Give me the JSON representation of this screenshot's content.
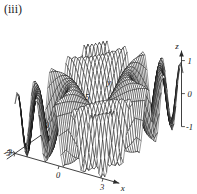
{
  "figure": {
    "panel_label": "(iii)",
    "type": "3d-surface-wireframe",
    "background_color": "#ffffff",
    "mesh_color": "#0d0d0d",
    "axis_color": "#2b2b2b"
  },
  "axes": {
    "x": {
      "label": "x",
      "ticks": [
        "-3",
        "0",
        "3"
      ],
      "range": [
        -3,
        3
      ]
    },
    "y": {
      "label": "y",
      "ticks": [
        "-5",
        "0",
        "5"
      ],
      "range": [
        -5,
        5
      ]
    },
    "z": {
      "label": "z",
      "ticks": [
        "1",
        "0",
        "-1"
      ],
      "range": [
        -1,
        1
      ]
    }
  },
  "chart_data": {
    "type": "surface",
    "title": "(iii)",
    "xlabel": "x",
    "ylabel": "y",
    "zlabel": "z",
    "xlim": [
      -3,
      3
    ],
    "ylim": [
      -5,
      5
    ],
    "zlim": [
      -1,
      1
    ],
    "xticks": [
      -3,
      0,
      3
    ],
    "yticks": [
      -5,
      0,
      5
    ],
    "zticks": [
      -1,
      0,
      1
    ],
    "grid": false,
    "legend": "none",
    "wireframe": true,
    "surface_function": "sin(x*y)",
    "mesh_nx": 44,
    "mesh_ny": 44,
    "projection": {
      "azimuth_deg": -58,
      "elevation_deg": 26
    }
  }
}
